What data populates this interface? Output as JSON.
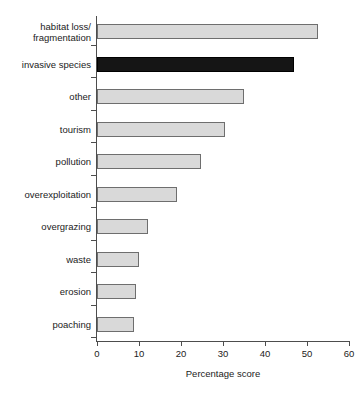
{
  "chart_data": {
    "type": "bar",
    "orientation": "horizontal",
    "title": "",
    "xlabel": "Percentage score",
    "ylabel": "",
    "xlim": [
      0,
      60
    ],
    "xticks": [
      0,
      10,
      20,
      30,
      40,
      50,
      60
    ],
    "grid": false,
    "legend": null,
    "categories": [
      "habitat loss/\nfragmentation",
      "invasive species",
      "other",
      "tourism",
      "pollution",
      "overexploitation",
      "overgrazing",
      "waste",
      "erosion",
      "poaching"
    ],
    "values": [
      52.5,
      47.0,
      35.0,
      30.5,
      24.8,
      19.0,
      12.1,
      10.0,
      9.3,
      8.9
    ],
    "highlighted_category": "invasive species",
    "colors": {
      "bar_fill": "#d9d9d9",
      "bar_border": "#6e6e6e",
      "highlight_fill": "#151515",
      "highlight_border": "#000000",
      "axis": "#4d4d4d",
      "text": "#1b1b1b",
      "background": "#ffffff"
    }
  }
}
